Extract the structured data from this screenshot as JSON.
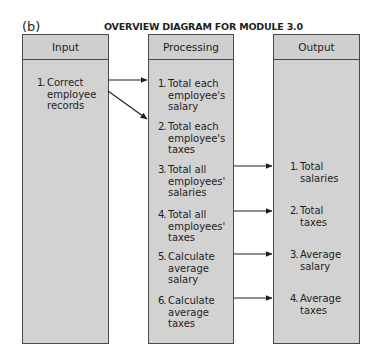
{
  "figure_label": "(b)",
  "title": "OVERVIEW DIAGRAM FOR MODULE 3.0",
  "colors": {
    "box_fill": "#d2d2d2",
    "border": "#4a4a4a",
    "text": "#1e1e1e"
  },
  "columns": [
    {
      "header": "Input",
      "items": [
        {
          "num": "1.",
          "text": "Correct\nemployee\nrecords"
        }
      ]
    },
    {
      "header": "Processing",
      "items": [
        {
          "num": "1.",
          "text": "Total each\nemployee's\nsalary"
        },
        {
          "num": "2.",
          "text": "Total each\nemployee's\ntaxes"
        },
        {
          "num": "3.",
          "text": "Total all\nemployees'\nsalaries"
        },
        {
          "num": "4.",
          "text": "Total all\nemployees'\ntaxes"
        },
        {
          "num": "5.",
          "text": "Calculate\naverage\nsalary"
        },
        {
          "num": "6.",
          "text": "Calculate\naverage\ntaxes"
        }
      ]
    },
    {
      "header": "Output",
      "items": [
        {
          "num": "1.",
          "text": "Total\nsalaries"
        },
        {
          "num": "2.",
          "text": "Total\ntaxes"
        },
        {
          "num": "3.",
          "text": "Average\nsalary"
        },
        {
          "num": "4.",
          "text": "Average\ntaxes"
        }
      ]
    }
  ],
  "connections": [
    {
      "from": "Input 1",
      "to": "Processing 1"
    },
    {
      "from": "Input 1",
      "to": "Processing 2"
    },
    {
      "from": "Processing 3",
      "to": "Output 1"
    },
    {
      "from": "Processing 4",
      "to": "Output 2"
    },
    {
      "from": "Processing 5",
      "to": "Output 3"
    },
    {
      "from": "Processing 6",
      "to": "Output 4"
    }
  ]
}
